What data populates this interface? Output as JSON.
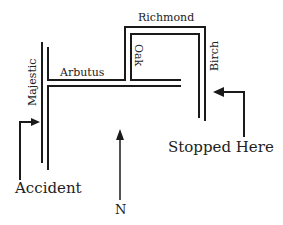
{
  "streets": {
    "majestic": "Majestic",
    "arbutus": "Arbutus",
    "oak": "Oak",
    "richmond": "Richmond",
    "birch": "Birch"
  },
  "annotations": {
    "accident": "Accident",
    "stopped_here": "Stopped Here",
    "north": "N"
  },
  "colors": {
    "line": "#1a1a1a",
    "background": "#ffffff"
  }
}
